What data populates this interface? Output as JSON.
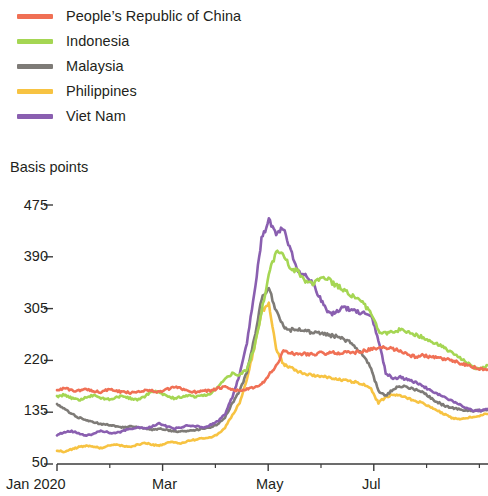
{
  "legend": {
    "position": "top-left",
    "items": [
      {
        "label": "People’s Republic of China",
        "color": "#f07055",
        "key": "prc"
      },
      {
        "label": "Indonesia",
        "color": "#a5d653",
        "key": "ind"
      },
      {
        "label": "Malaysia",
        "color": "#7e7b77",
        "key": "mal"
      },
      {
        "label": "Philippines",
        "color": "#f7c342",
        "key": "phi"
      },
      {
        "label": "Viet Nam",
        "color": "#8a5fb0",
        "key": "vie"
      }
    ]
  },
  "axis": {
    "y_title": "Basis points",
    "y_ticks": [
      "475",
      "390",
      "305",
      "220",
      "135",
      "50"
    ],
    "x_ticks": [
      "Jan 2020",
      "Mar",
      "May",
      "Jul"
    ]
  },
  "chart_data": {
    "type": "line",
    "title": "",
    "subtitle": "",
    "xlabel": "",
    "ylabel": "Basis points",
    "ylim": [
      50,
      475
    ],
    "ytick_values": [
      50,
      135,
      220,
      305,
      390,
      475
    ],
    "grid": false,
    "legend_position": "top-left",
    "x_major_tick_labels": [
      "Jan 2020",
      "Mar",
      "May",
      "Jul"
    ],
    "x_major_tick_fractions": [
      0.0,
      0.245,
      0.49,
      0.735
    ],
    "x_minor_tick_fractions": [
      0.1225,
      0.3675,
      0.6125,
      0.8575,
      0.98
    ],
    "x_axis_note": "daily observations, Jan 2020 through approx. Aug 2020",
    "x_index_count": 60,
    "series": [
      {
        "name": "People’s Republic of China",
        "color": "#f07055",
        "values": [
          172,
          174,
          171,
          170,
          173,
          170,
          168,
          172,
          170,
          168,
          167,
          169,
          171,
          170,
          168,
          172,
          176,
          174,
          170,
          168,
          171,
          170,
          174,
          176,
          172,
          170,
          173,
          175,
          180,
          196,
          210,
          236,
          232,
          230,
          231,
          230,
          232,
          231,
          233,
          232,
          234,
          233,
          236,
          238,
          240,
          241,
          239,
          236,
          230,
          226,
          228,
          226,
          224,
          222,
          220,
          216,
          212,
          209,
          206,
          205
        ]
      },
      {
        "name": "Indonesia",
        "color": "#a5d653",
        "values": [
          160,
          164,
          158,
          155,
          160,
          163,
          158,
          156,
          159,
          162,
          158,
          155,
          160,
          170,
          168,
          162,
          158,
          160,
          163,
          160,
          162,
          165,
          175,
          190,
          198,
          196,
          205,
          240,
          300,
          362,
          398,
          392,
          370,
          366,
          350,
          346,
          352,
          356,
          344,
          338,
          330,
          322,
          312,
          298,
          268,
          264,
          268,
          270,
          266,
          262,
          258,
          252,
          248,
          240,
          232,
          226,
          218,
          208,
          206,
          212
        ]
      },
      {
        "name": "Malaysia",
        "color": "#7e7b77",
        "values": [
          148,
          140,
          132,
          126,
          122,
          118,
          116,
          114,
          112,
          110,
          112,
          110,
          108,
          106,
          108,
          106,
          104,
          103,
          104,
          106,
          108,
          110,
          115,
          126,
          150,
          170,
          200,
          255,
          320,
          340,
          300,
          276,
          270,
          272,
          268,
          266,
          264,
          262,
          260,
          256,
          250,
          240,
          228,
          206,
          170,
          162,
          172,
          178,
          176,
          172,
          168,
          160,
          152,
          146,
          142,
          140,
          138,
          137,
          138,
          140
        ]
      },
      {
        "name": "Philippines",
        "color": "#f7c342",
        "values": [
          72,
          70,
          74,
          78,
          80,
          78,
          76,
          80,
          82,
          80,
          78,
          82,
          84,
          82,
          80,
          84,
          86,
          84,
          88,
          90,
          92,
          94,
          98,
          110,
          130,
          150,
          190,
          240,
          300,
          312,
          240,
          214,
          208,
          202,
          198,
          196,
          194,
          192,
          190,
          188,
          186,
          184,
          180,
          172,
          150,
          160,
          164,
          162,
          158,
          154,
          150,
          144,
          138,
          132,
          126,
          124,
          126,
          128,
          130,
          132
        ]
      },
      {
        "name": "Viet Nam",
        "color": "#8a5fb0",
        "values": [
          98,
          102,
          104,
          100,
          96,
          100,
          104,
          102,
          100,
          104,
          108,
          110,
          108,
          112,
          116,
          112,
          108,
          110,
          114,
          112,
          110,
          114,
          120,
          132,
          160,
          196,
          250,
          330,
          420,
          450,
          430,
          436,
          400,
          366,
          360,
          348,
          322,
          300,
          296,
          306,
          304,
          300,
          298,
          296,
          254,
          200,
          190,
          192,
          188,
          184,
          178,
          172,
          166,
          160,
          154,
          148,
          142,
          138,
          138,
          140
        ]
      }
    ]
  }
}
